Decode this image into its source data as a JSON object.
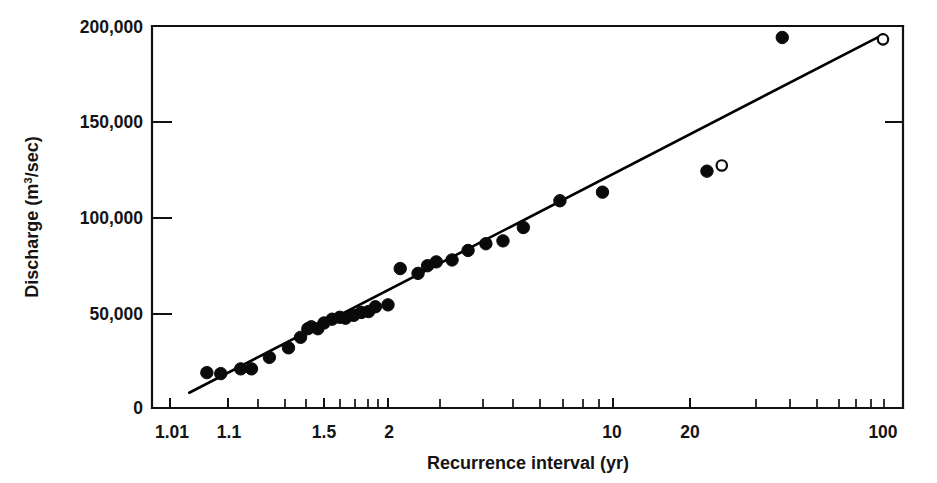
{
  "chart_data": {
    "type": "scatter",
    "title": "",
    "subtitle": "",
    "xlabel": "Recurrence interval (yr)",
    "ylabel_prefix": "Discharge (m",
    "ylabel_sup": "3",
    "ylabel_suffix": "/sec)",
    "ylabel_plain": "Discharge (m3/sec)",
    "x_scale": "log-gumbel",
    "y_scale": "linear",
    "xlim": [
      1.01,
      100
    ],
    "ylim": [
      0,
      200000
    ],
    "grid": false,
    "legend": "none",
    "x_tick_labels": [
      "1.01",
      "1.1",
      "1.5",
      "2",
      "10",
      "20",
      "100"
    ],
    "x_tick_values": [
      1.01,
      1.1,
      1.5,
      2,
      10,
      20,
      100
    ],
    "y_tick_labels": [
      "0",
      "50,000",
      "100,000",
      "150,000",
      "200,000"
    ],
    "y_tick_values": [
      0,
      50000,
      100000,
      150000,
      200000
    ],
    "x_minor_tick_values": [
      1.2,
      1.3,
      1.4,
      1.6,
      1.7,
      1.8,
      1.9,
      2.5,
      3,
      4,
      5,
      6,
      7,
      8,
      9,
      30,
      40,
      50,
      60,
      70,
      80,
      90
    ],
    "series": [
      {
        "name": "Observed annual peak discharge",
        "marker": "filled-circle",
        "color": "#0a0a0a",
        "points": [
          {
            "x": 1.05,
            "y": 18500
          },
          {
            "x": 1.08,
            "y": 18000
          },
          {
            "x": 1.13,
            "y": 20500
          },
          {
            "x": 1.16,
            "y": 20500
          },
          {
            "x": 1.22,
            "y": 26500
          },
          {
            "x": 1.3,
            "y": 31500
          },
          {
            "x": 1.36,
            "y": 37000
          },
          {
            "x": 1.4,
            "y": 41500
          },
          {
            "x": 1.42,
            "y": 42500
          },
          {
            "x": 1.46,
            "y": 41500
          },
          {
            "x": 1.5,
            "y": 44500
          },
          {
            "x": 1.55,
            "y": 46500
          },
          {
            "x": 1.6,
            "y": 47500
          },
          {
            "x": 1.64,
            "y": 47000
          },
          {
            "x": 1.7,
            "y": 48500
          },
          {
            "x": 1.76,
            "y": 50000
          },
          {
            "x": 1.82,
            "y": 50500
          },
          {
            "x": 1.88,
            "y": 53000
          },
          {
            "x": 2.0,
            "y": 54000
          },
          {
            "x": 2.15,
            "y": 73000
          },
          {
            "x": 2.4,
            "y": 70500
          },
          {
            "x": 2.55,
            "y": 74500
          },
          {
            "x": 2.7,
            "y": 76500
          },
          {
            "x": 3.0,
            "y": 77500
          },
          {
            "x": 3.35,
            "y": 82500
          },
          {
            "x": 3.8,
            "y": 86000
          },
          {
            "x": 4.3,
            "y": 87500
          },
          {
            "x": 5.0,
            "y": 94500
          },
          {
            "x": 6.6,
            "y": 108500
          },
          {
            "x": 9.2,
            "y": 113000
          },
          {
            "x": 23.0,
            "y": 124000
          },
          {
            "x": 43.0,
            "y": 194000
          }
        ]
      },
      {
        "name": "Historic / estimated peak discharge",
        "marker": "open-circle",
        "color": "#0a0a0a",
        "points": [
          {
            "x": 26.0,
            "y": 127000
          },
          {
            "x": 100.0,
            "y": 193000
          }
        ]
      }
    ],
    "fit_line": {
      "name": "Fitted frequency curve",
      "x_start": 1.025,
      "y_start": 8000,
      "x_end": 100.0,
      "y_end": 195500
    }
  }
}
